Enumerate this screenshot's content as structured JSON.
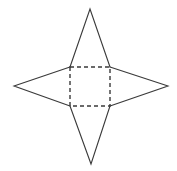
{
  "figure": {
    "canvas": {
      "width": 177,
      "height": 171,
      "background": "#ffffff"
    },
    "style": {
      "solid_stroke_color": "#3a3a3a",
      "dashed_stroke_color": "#3a3a3a",
      "solid_stroke_width": 1.1,
      "dashed_stroke_width": 1.4,
      "dash_pattern": "4 3"
    },
    "square": {
      "name": "center-square",
      "line_style": "dashed",
      "left": 70,
      "top": 67,
      "right": 110,
      "bottom": 106,
      "corners": [
        {
          "label": "top-left",
          "x": 70,
          "y": 67
        },
        {
          "label": "top-right",
          "x": 110,
          "y": 67
        },
        {
          "label": "bottom-right",
          "x": 110,
          "y": 106
        },
        {
          "label": "bottom-left",
          "x": 70,
          "y": 106
        }
      ]
    },
    "triangles": [
      {
        "name": "top-triangle",
        "line_style": "solid",
        "apex": {
          "x": 90,
          "y": 9
        },
        "base": [
          {
            "x": 70,
            "y": 67
          },
          {
            "x": 110,
            "y": 67
          }
        ],
        "path": "M 70 67 L 90 9 L 110 67"
      },
      {
        "name": "right-triangle",
        "line_style": "solid",
        "apex": {
          "x": 168,
          "y": 86
        },
        "base": [
          {
            "x": 110,
            "y": 67
          },
          {
            "x": 110,
            "y": 106
          }
        ],
        "path": "M 110 67 L 168 86 L 110 106"
      },
      {
        "name": "bottom-triangle",
        "line_style": "solid",
        "apex": {
          "x": 91,
          "y": 164
        },
        "base": [
          {
            "x": 110,
            "y": 106
          },
          {
            "x": 70,
            "y": 106
          }
        ],
        "path": "M 110 106 L 91 164 L 70 106"
      },
      {
        "name": "left-triangle",
        "line_style": "solid",
        "apex": {
          "x": 14,
          "y": 86
        },
        "base": [
          {
            "x": 70,
            "y": 106
          },
          {
            "x": 70,
            "y": 67
          }
        ],
        "path": "M 70 106 L 14 86 L 70 67"
      }
    ]
  }
}
